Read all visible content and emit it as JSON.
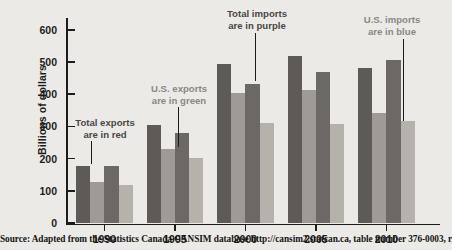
{
  "chart_data": {
    "type": "bar",
    "title": "",
    "subtitle": "",
    "xlabel": "",
    "ylabel": "Billions of dollars",
    "categories": [
      "1990",
      "1995",
      "2000",
      "2005",
      "2010"
    ],
    "ylim": [
      0,
      640
    ],
    "yticks": [
      0,
      100,
      200,
      300,
      400,
      500,
      600
    ],
    "ytick_labels": [
      "0",
      "100",
      "200",
      "300",
      "400",
      "500",
      "600"
    ],
    "grid": false,
    "legend_position": "none",
    "series": [
      {
        "name": "Total exports",
        "color": "#5d5a58",
        "values": [
          176,
          306,
          495,
          519,
          481
        ]
      },
      {
        "name": "U.S. exports",
        "color": "#9e9b96",
        "values": [
          126,
          230,
          404,
          412,
          343
        ]
      },
      {
        "name": "Total imports",
        "color": "#6b6865",
        "values": [
          177,
          281,
          432,
          468,
          508
        ]
      },
      {
        "name": "U.S. imports",
        "color": "#b5b2ac",
        "values": [
          117,
          202,
          312,
          308,
          317
        ]
      }
    ],
    "annotations": [
      {
        "id": "total-exports",
        "line1": "Total exports",
        "line2": "are in red",
        "color": "#4a4745",
        "text_left": 58,
        "text_top": 117,
        "text_width": 94,
        "leader_x": 91,
        "leader_top": 141,
        "leader_height": 23
      },
      {
        "id": "us-exports",
        "line1": "U.S. exports",
        "line2": "are in green",
        "color": "#8b8883",
        "text_left": 132,
        "text_top": 83,
        "text_width": 94,
        "leader_x": 178,
        "leader_top": 107,
        "leader_height": 40
      },
      {
        "id": "total-imports",
        "line1": "Total imports",
        "line2": "are in purple",
        "color": "#4a4745",
        "text_left": 207,
        "text_top": 8,
        "text_width": 100,
        "leader_x": 255,
        "leader_top": 33,
        "leader_height": 48
      },
      {
        "id": "us-imports",
        "line1": "U.S. imports",
        "line2": "are in blue",
        "color": "#8b8883",
        "text_left": 342,
        "text_top": 14,
        "text_width": 100,
        "leader_x": 403,
        "leader_top": 39,
        "leader_height": 82
      }
    ]
  },
  "source": {
    "text": "Source: Adapted from the Statistics Canada CANSIM database http://cansim2.statcan.ca, table number 376-0003, retrieved May 9, 2011."
  },
  "colors": {
    "background": "#eceae7",
    "axis": "#1c1c1c",
    "text": "#1c1c1c"
  }
}
